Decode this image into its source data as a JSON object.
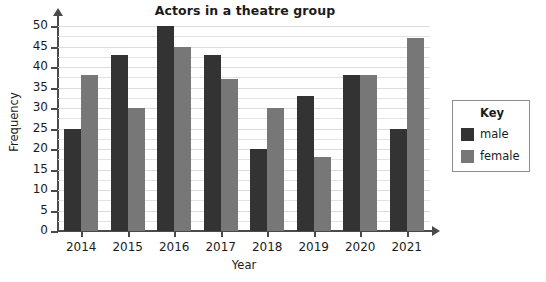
{
  "chart_data": {
    "type": "bar",
    "title": "Actors in a theatre group",
    "xlabel": "Year",
    "ylabel": "Frequency",
    "categories": [
      "2014",
      "2015",
      "2016",
      "2017",
      "2018",
      "2019",
      "2020",
      "2021"
    ],
    "series": [
      {
        "name": "male",
        "color": "#333333",
        "values": [
          25,
          43,
          50,
          43,
          20,
          33,
          38,
          25
        ]
      },
      {
        "name": "female",
        "color": "#777777",
        "values": [
          38,
          30,
          45,
          37,
          30,
          18,
          38,
          47
        ]
      }
    ],
    "ylim": [
      0,
      50
    ],
    "ytick_step": 5,
    "yticks": [
      "0",
      "5",
      "10",
      "15",
      "20",
      "25",
      "30",
      "35",
      "40",
      "45",
      "50"
    ],
    "grid": true,
    "legend_position": "right"
  },
  "legend": {
    "title": "Key",
    "entries": [
      {
        "label": "male"
      },
      {
        "label": "female"
      }
    ]
  }
}
